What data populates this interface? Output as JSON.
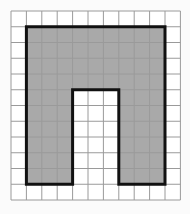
{
  "figure": {
    "type": "grid-shape",
    "grid": {
      "columns": 11,
      "rows": 12,
      "origin_px": [
        11,
        11
      ],
      "cell_w_px": 15.4,
      "cell_h_px": 15.75,
      "line_color": "#9a9a9a",
      "background_color": "#ffffff"
    },
    "shape": {
      "fill_color": "#a9a9a9",
      "outline_color": "#111111",
      "outline_width_px": 3,
      "outer_bounds_cells": {
        "col_start": 1,
        "col_end": 10,
        "row_start": 1,
        "row_end": 11
      },
      "notch_cells": {
        "col_start": 4,
        "col_end": 7,
        "row_start": 5,
        "row_end": 11
      },
      "polygon_cells": [
        [
          1,
          1
        ],
        [
          10,
          1
        ],
        [
          10,
          11
        ],
        [
          7,
          11
        ],
        [
          7,
          5
        ],
        [
          4,
          5
        ],
        [
          4,
          11
        ],
        [
          1,
          11
        ]
      ],
      "shaded_cell_count": 72
    }
  }
}
